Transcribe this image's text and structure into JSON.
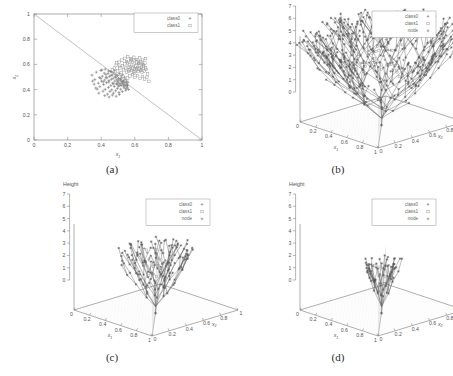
{
  "figure": {
    "panels": [
      {
        "caption": "(a)",
        "type": "scatter2d"
      },
      {
        "caption": "(b)",
        "type": "tree3d"
      },
      {
        "caption": "(c)",
        "type": "tree3d"
      },
      {
        "caption": "(d)",
        "type": "tree3d"
      }
    ]
  },
  "legend": {
    "panel_a": [
      {
        "label": "class0",
        "marker": "plus-marker",
        "color": "#777777"
      },
      {
        "label": "class1",
        "marker": "square-marker",
        "color": "#999999"
      }
    ],
    "panel_3d": [
      {
        "label": "class0",
        "marker": "plus-marker",
        "color": "#777777"
      },
      {
        "label": "class1",
        "marker": "square-marker",
        "color": "#999999"
      },
      {
        "label": "node",
        "marker": "star-marker",
        "color": "#888888"
      }
    ]
  },
  "chart_data": [
    {
      "type": "scatter",
      "panel": "(a)",
      "title": "",
      "xlabel": "x1",
      "ylabel": "x2",
      "xlim": [
        0,
        1
      ],
      "ylim": [
        0,
        1
      ],
      "xticks": [
        "0",
        "0.2",
        "0.4",
        "0.6",
        "0.8",
        "1"
      ],
      "yticks": [
        "0",
        "0.2",
        "0.4",
        "0.6",
        "0.8",
        "1"
      ],
      "grid": false,
      "legend_position": "top-right",
      "annotations": [
        {
          "name": "decision-boundary",
          "text": "x1 + x2 = 1",
          "from": [
            0,
            1
          ],
          "to": [
            1,
            0
          ]
        }
      ],
      "series": [
        {
          "name": "class0",
          "marker": "plus",
          "points": [
            [
              0.345,
              0.515
            ],
            [
              0.362,
              0.479
            ],
            [
              0.371,
              0.538
            ],
            [
              0.383,
              0.451
            ],
            [
              0.389,
              0.497
            ],
            [
              0.392,
              0.423
            ],
            [
              0.398,
              0.552
            ],
            [
              0.402,
              0.468
            ],
            [
              0.407,
              0.506
            ],
            [
              0.411,
              0.388
            ],
            [
              0.414,
              0.441
            ],
            [
              0.418,
              0.531
            ],
            [
              0.421,
              0.476
            ],
            [
              0.424,
              0.402
            ],
            [
              0.428,
              0.519
            ],
            [
              0.431,
              0.455
            ],
            [
              0.434,
              0.493
            ],
            [
              0.437,
              0.364
            ],
            [
              0.441,
              0.528
            ],
            [
              0.443,
              0.417
            ],
            [
              0.446,
              0.471
            ],
            [
              0.449,
              0.505
            ],
            [
              0.452,
              0.386
            ],
            [
              0.455,
              0.544
            ],
            [
              0.457,
              0.432
            ],
            [
              0.46,
              0.482
            ],
            [
              0.463,
              0.398
            ],
            [
              0.466,
              0.516
            ],
            [
              0.468,
              0.451
            ],
            [
              0.471,
              0.489
            ],
            [
              0.473,
              0.372
            ],
            [
              0.476,
              0.534
            ],
            [
              0.478,
              0.425
            ],
            [
              0.481,
              0.467
            ],
            [
              0.483,
              0.503
            ],
            [
              0.486,
              0.391
            ],
            [
              0.488,
              0.521
            ],
            [
              0.491,
              0.446
            ],
            [
              0.493,
              0.478
            ],
            [
              0.496,
              0.409
            ],
            [
              0.498,
              0.512
            ],
            [
              0.501,
              0.458
            ],
            [
              0.503,
              0.487
            ],
            [
              0.506,
              0.377
            ],
            [
              0.508,
              0.527
            ],
            [
              0.511,
              0.436
            ],
            [
              0.513,
              0.474
            ],
            [
              0.516,
              0.403
            ],
            [
              0.518,
              0.509
            ],
            [
              0.521,
              0.462
            ],
            [
              0.523,
              0.492
            ],
            [
              0.526,
              0.384
            ],
            [
              0.528,
              0.518
            ],
            [
              0.531,
              0.441
            ],
            [
              0.533,
              0.47
            ],
            [
              0.536,
              0.414
            ],
            [
              0.538,
              0.498
            ],
            [
              0.541,
              0.455
            ],
            [
              0.543,
              0.481
            ],
            [
              0.546,
              0.395
            ],
            [
              0.548,
              0.43
            ],
            [
              0.551,
              0.466
            ],
            [
              0.553,
              0.444
            ],
            [
              0.556,
              0.419
            ],
            [
              0.559,
              0.458
            ],
            [
              0.421,
              0.352
            ],
            [
              0.447,
              0.341
            ],
            [
              0.466,
              0.356
            ],
            [
              0.489,
              0.347
            ],
            [
              0.508,
              0.361
            ],
            [
              0.376,
              0.404
            ],
            [
              0.358,
              0.443
            ],
            [
              0.349,
              0.468
            ],
            [
              0.368,
              0.413
            ],
            [
              0.386,
              0.372
            ],
            [
              0.404,
              0.556
            ],
            [
              0.424,
              0.562
            ],
            [
              0.443,
              0.548
            ],
            [
              0.462,
              0.541
            ],
            [
              0.481,
              0.553
            ],
            [
              0.496,
              0.441
            ],
            [
              0.503,
              0.426
            ],
            [
              0.512,
              0.448
            ],
            [
              0.519,
              0.433
            ],
            [
              0.527,
              0.452
            ],
            [
              0.534,
              0.427
            ],
            [
              0.541,
              0.437
            ],
            [
              0.549,
              0.408
            ],
            [
              0.556,
              0.432
            ],
            [
              0.563,
              0.401
            ],
            [
              0.398,
              0.489
            ],
            [
              0.412,
              0.462
            ],
            [
              0.429,
              0.497
            ],
            [
              0.445,
              0.459
            ],
            [
              0.459,
              0.513
            ],
            [
              0.474,
              0.446
            ],
            [
              0.487,
              0.496
            ],
            [
              0.499,
              0.468
            ],
            [
              0.514,
              0.484
            ],
            [
              0.529,
              0.463
            ]
          ]
        },
        {
          "name": "class1",
          "marker": "square",
          "points": [
            [
              0.498,
              0.548
            ],
            [
              0.511,
              0.572
            ],
            [
              0.519,
              0.536
            ],
            [
              0.527,
              0.589
            ],
            [
              0.534,
              0.557
            ],
            [
              0.541,
              0.604
            ],
            [
              0.546,
              0.571
            ],
            [
              0.552,
              0.538
            ],
            [
              0.556,
              0.612
            ],
            [
              0.561,
              0.578
            ],
            [
              0.564,
              0.545
            ],
            [
              0.568,
              0.596
            ],
            [
              0.572,
              0.562
            ],
            [
              0.576,
              0.628
            ],
            [
              0.579,
              0.584
            ],
            [
              0.583,
              0.551
            ],
            [
              0.586,
              0.617
            ],
            [
              0.589,
              0.573
            ],
            [
              0.593,
              0.541
            ],
            [
              0.596,
              0.602
            ],
            [
              0.599,
              0.566
            ],
            [
              0.603,
              0.631
            ],
            [
              0.606,
              0.588
            ],
            [
              0.609,
              0.554
            ],
            [
              0.613,
              0.619
            ],
            [
              0.616,
              0.576
            ],
            [
              0.619,
              0.543
            ],
            [
              0.623,
              0.607
            ],
            [
              0.626,
              0.564
            ],
            [
              0.629,
              0.593
            ],
            [
              0.633,
              0.551
            ],
            [
              0.636,
              0.622
            ],
            [
              0.639,
              0.578
            ],
            [
              0.643,
              0.536
            ],
            [
              0.646,
              0.601
            ],
            [
              0.649,
              0.566
            ],
            [
              0.653,
              0.589
            ],
            [
              0.656,
              0.547
            ],
            [
              0.661,
              0.611
            ],
            [
              0.664,
              0.572
            ],
            [
              0.541,
              0.648
            ],
            [
              0.558,
              0.661
            ],
            [
              0.576,
              0.643
            ],
            [
              0.594,
              0.657
            ],
            [
              0.611,
              0.639
            ],
            [
              0.629,
              0.652
            ],
            [
              0.646,
              0.634
            ],
            [
              0.664,
              0.646
            ],
            [
              0.523,
              0.634
            ],
            [
              0.506,
              0.618
            ],
            [
              0.571,
              0.508
            ],
            [
              0.586,
              0.519
            ],
            [
              0.601,
              0.497
            ],
            [
              0.616,
              0.512
            ],
            [
              0.631,
              0.489
            ],
            [
              0.646,
              0.504
            ],
            [
              0.659,
              0.483
            ],
            [
              0.672,
              0.498
            ],
            [
              0.684,
              0.466
            ],
            [
              0.558,
              0.492
            ],
            [
              0.489,
              0.594
            ],
            [
              0.478,
              0.571
            ],
            [
              0.493,
              0.612
            ],
            [
              0.466,
              0.556
            ],
            [
              0.508,
              0.586
            ],
            [
              0.551,
              0.623
            ],
            [
              0.566,
              0.556
            ],
            [
              0.581,
              0.637
            ],
            [
              0.598,
              0.528
            ],
            [
              0.612,
              0.566
            ],
            [
              0.624,
              0.614
            ],
            [
              0.638,
              0.559
            ],
            [
              0.651,
              0.598
            ],
            [
              0.667,
              0.561
            ],
            [
              0.676,
              0.524
            ]
          ]
        }
      ]
    },
    {
      "type": "scatter",
      "panel": "(b)",
      "title": "",
      "zlabel": "Height",
      "xlabel": "x1",
      "ylabel": "x2",
      "xlim": [
        0,
        1
      ],
      "ylim": [
        0,
        1
      ],
      "zlim": [
        0,
        7
      ],
      "xticks": [
        "0",
        "0.2",
        "0.4",
        "0.6",
        "0.8",
        "1"
      ],
      "yticks": [
        "0",
        "0.2",
        "0.4",
        "0.6",
        "0.8",
        "1"
      ],
      "zticks": [
        "0",
        "1",
        "2",
        "3",
        "4",
        "5",
        "6",
        "7"
      ],
      "grid": true,
      "legend_position": "top-right",
      "tree": {
        "node_count": 260,
        "max_height": 7,
        "spread": 1.0,
        "density": 1.0
      }
    },
    {
      "type": "scatter",
      "panel": "(c)",
      "title": "",
      "zlabel": "Height",
      "xlabel": "x1",
      "ylabel": "x2",
      "xlim": [
        0,
        1
      ],
      "ylim": [
        0,
        1
      ],
      "zlim": [
        0,
        7
      ],
      "xticks": [
        "0",
        "0.2",
        "0.4",
        "0.6",
        "0.8",
        "1"
      ],
      "yticks": [
        "0",
        "0.2",
        "0.4",
        "0.6",
        "0.8",
        "1"
      ],
      "zticks": [
        "0",
        "1",
        "2",
        "3",
        "4",
        "5",
        "6",
        "7"
      ],
      "grid": true,
      "legend_position": "top-right",
      "tree": {
        "node_count": 90,
        "max_height": 5,
        "spread": 0.55,
        "density": 0.45
      }
    },
    {
      "type": "scatter",
      "panel": "(d)",
      "title": "",
      "zlabel": "Height",
      "xlabel": "x1",
      "ylabel": "x2",
      "xlim": [
        0,
        1
      ],
      "ylim": [
        0,
        1
      ],
      "zlim": [
        0,
        7
      ],
      "xticks": [
        "0",
        "0.2",
        "0.4",
        "0.6",
        "0.8",
        "1"
      ],
      "yticks": [
        "0",
        "0.2",
        "0.4",
        "0.6",
        "0.8",
        "1"
      ],
      "zticks": [
        "0",
        "1",
        "2",
        "3",
        "4",
        "5",
        "6",
        "7"
      ],
      "grid": true,
      "legend_position": "top-right",
      "tree": {
        "node_count": 45,
        "max_height": 4,
        "spread": 0.35,
        "density": 0.28
      }
    }
  ]
}
